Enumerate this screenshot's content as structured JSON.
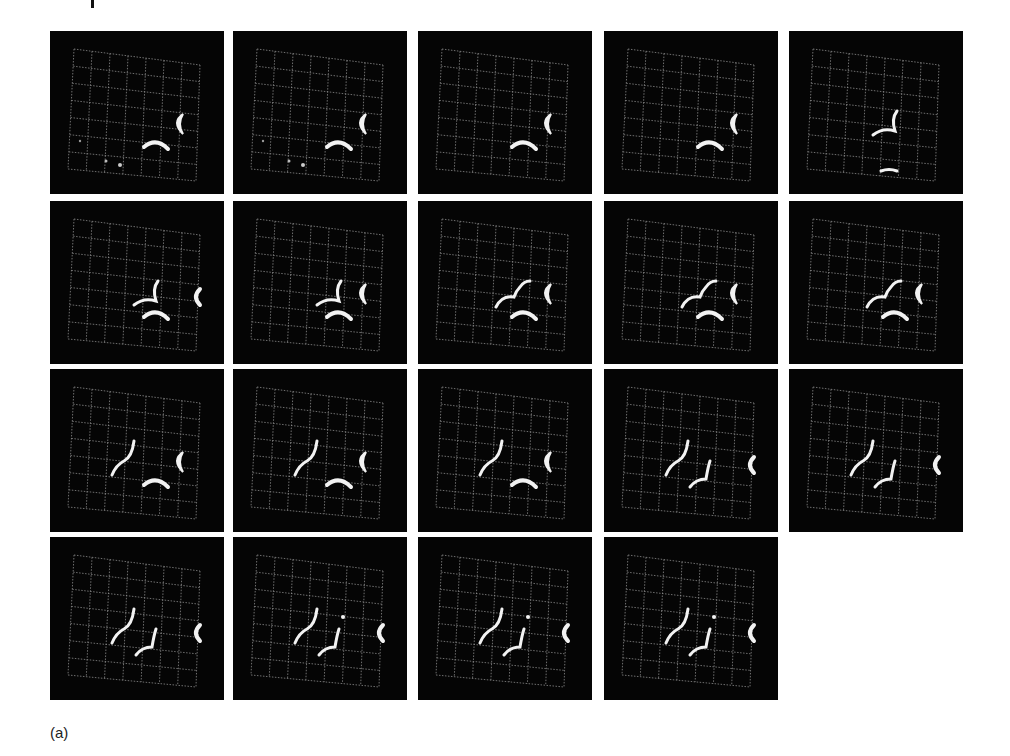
{
  "figure": {
    "caption_label": "(a)",
    "layout": {
      "rows": 4,
      "columns": 5,
      "frame_count": 19
    },
    "colors": {
      "background": "#ffffff",
      "frame_background": "#050505",
      "grid_line": "#8a8a8a",
      "object": "#f2f2f2"
    },
    "frames": [
      {
        "index": 1,
        "row": 0,
        "col": 0,
        "objects": [
          "crescent-right",
          "arc-bottom",
          "dots"
        ]
      },
      {
        "index": 2,
        "row": 0,
        "col": 1,
        "objects": [
          "crescent-right",
          "arc-bottom",
          "dots"
        ]
      },
      {
        "index": 3,
        "row": 0,
        "col": 2,
        "objects": [
          "crescent-right",
          "arc-bottom"
        ]
      },
      {
        "index": 4,
        "row": 0,
        "col": 3,
        "objects": [
          "crescent-right",
          "arc-bottom"
        ]
      },
      {
        "index": 5,
        "row": 0,
        "col": 4,
        "objects": [
          "hook",
          "arc-lower"
        ]
      },
      {
        "index": 6,
        "row": 1,
        "col": 0,
        "objects": [
          "hook",
          "crescent-edge",
          "arc-bottom"
        ]
      },
      {
        "index": 7,
        "row": 1,
        "col": 1,
        "objects": [
          "hook",
          "crescent-right",
          "arc-bottom"
        ]
      },
      {
        "index": 8,
        "row": 1,
        "col": 2,
        "objects": [
          "cloud-curve",
          "crescent-right",
          "arc-bottom"
        ]
      },
      {
        "index": 9,
        "row": 1,
        "col": 3,
        "objects": [
          "cloud-curve",
          "crescent-right",
          "arc-bottom"
        ]
      },
      {
        "index": 10,
        "row": 1,
        "col": 4,
        "objects": [
          "cloud-curve",
          "crescent-right",
          "arc-bottom"
        ]
      },
      {
        "index": 11,
        "row": 2,
        "col": 0,
        "objects": [
          "s-curve",
          "crescent-right",
          "arc-bottom"
        ]
      },
      {
        "index": 12,
        "row": 2,
        "col": 1,
        "objects": [
          "s-curve",
          "crescent-right",
          "arc-bottom"
        ]
      },
      {
        "index": 13,
        "row": 2,
        "col": 2,
        "objects": [
          "s-curve",
          "crescent-right",
          "arc-bottom"
        ]
      },
      {
        "index": 14,
        "row": 2,
        "col": 3,
        "objects": [
          "s-curve",
          "j-curve",
          "crescent-edge"
        ]
      },
      {
        "index": 15,
        "row": 2,
        "col": 4,
        "objects": [
          "s-curve",
          "j-curve",
          "crescent-edge"
        ]
      },
      {
        "index": 16,
        "row": 3,
        "col": 0,
        "objects": [
          "s-curve",
          "j-curve",
          "crescent-edge"
        ]
      },
      {
        "index": 17,
        "row": 3,
        "col": 1,
        "objects": [
          "s-curve",
          "j-curve",
          "dot",
          "crescent-edge"
        ]
      },
      {
        "index": 18,
        "row": 3,
        "col": 2,
        "objects": [
          "s-curve",
          "j-curve",
          "dot",
          "crescent-edge"
        ]
      },
      {
        "index": 19,
        "row": 3,
        "col": 3,
        "objects": [
          "s-curve",
          "j-curve",
          "dot",
          "crescent-edge"
        ]
      }
    ]
  }
}
